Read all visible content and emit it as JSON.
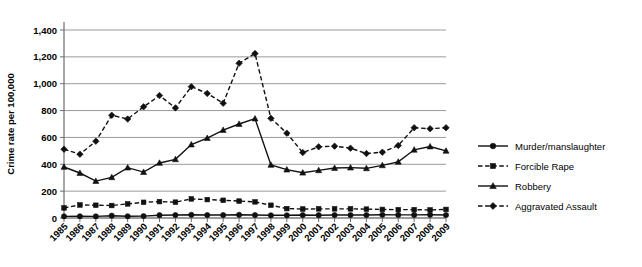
{
  "chart_data": {
    "type": "line",
    "title": "",
    "xlabel": "",
    "ylabel": "Crime rate per 100,000",
    "ylim": [
      0,
      1400
    ],
    "ytick_values": [
      0,
      200,
      400,
      600,
      800,
      1000,
      1200,
      1400
    ],
    "ytick_labels": [
      "0",
      "200",
      "400",
      "600",
      "800",
      "1,000",
      "1,200",
      "1,400"
    ],
    "grid": true,
    "legend_position": "right",
    "categories": [
      "1985",
      "1986",
      "1987",
      "1988",
      "1989",
      "1990",
      "1991",
      "1992",
      "1993",
      "1994",
      "1995",
      "1996",
      "1997",
      "1998",
      "1999",
      "2000",
      "2001",
      "2002",
      "2003",
      "2004",
      "2005",
      "2006",
      "2007",
      "2008",
      "2009"
    ],
    "series": [
      {
        "name": "Murder/manslaughter",
        "marker": "circle",
        "dash": "solid",
        "color": "#111111",
        "values": [
          12,
          13,
          12,
          17,
          13,
          14,
          21,
          22,
          24,
          22,
          22,
          24,
          22,
          20,
          20,
          22,
          21,
          22,
          22,
          22,
          24,
          23,
          23,
          24,
          22
        ]
      },
      {
        "name": "Forcible Rape",
        "marker": "square",
        "dash": "dashed",
        "color": "#111111",
        "values": [
          75,
          97,
          95,
          93,
          105,
          117,
          122,
          118,
          142,
          137,
          132,
          126,
          120,
          95,
          70,
          67,
          68,
          68,
          68,
          66,
          64,
          62,
          62,
          60,
          64
        ]
      },
      {
        "name": "Robbery",
        "marker": "triangle",
        "dash": "solid",
        "color": "#111111",
        "values": [
          380,
          335,
          275,
          303,
          375,
          342,
          410,
          437,
          547,
          595,
          655,
          700,
          740,
          395,
          360,
          337,
          355,
          372,
          375,
          370,
          392,
          418,
          508,
          532,
          500
        ]
      },
      {
        "name": "Aggravated Assault",
        "marker": "diamond",
        "dash": "dashed",
        "color": "#111111",
        "values": [
          512,
          475,
          572,
          765,
          737,
          828,
          912,
          820,
          978,
          928,
          855,
          1152,
          1225,
          742,
          632,
          487,
          530,
          535,
          520,
          480,
          490,
          540,
          672,
          665,
          672
        ]
      }
    ]
  }
}
